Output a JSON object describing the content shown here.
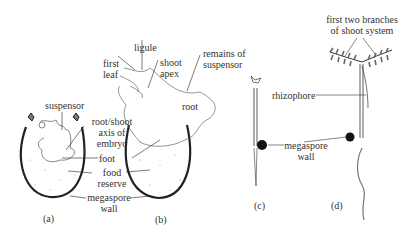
{
  "panels": {
    "a": {
      "caption": "(a)",
      "labels": {
        "suspensor": "suspensor",
        "root_shoot_axis_1": "root/shoot",
        "root_shoot_axis_2": "axis of",
        "root_shoot_axis_3": "embryo",
        "foot": "foot",
        "food_reserve_1": "food",
        "food_reserve_2": "reserve",
        "megaspore_wall_1": "megaspore",
        "megaspore_wall_2": "wall"
      }
    },
    "b": {
      "caption": "(b)",
      "labels": {
        "first_leaf_1": "first",
        "first_leaf_2": "leaf",
        "ligule": "ligule",
        "shoot_apex_1": "shoot",
        "shoot_apex_2": "apex",
        "remains_1": "remains of",
        "remains_2": "suspensor",
        "root": "root"
      }
    },
    "c": {
      "caption": "(c)",
      "labels": {
        "megaspore_wall_1": "megaspore",
        "megaspore_wall_2": "wall"
      }
    },
    "d": {
      "caption": "(d)",
      "labels": {
        "branches_1": "first two branches",
        "branches_2": "of shoot system",
        "rhizophore": "rhizophore"
      }
    }
  }
}
